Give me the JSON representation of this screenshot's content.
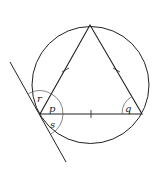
{
  "diagram": {
    "labels": {
      "r": "r",
      "p": "p",
      "s": "s",
      "q": "q"
    },
    "colors": {
      "stroke": "#222222",
      "arc": "#555555",
      "background": "#ffffff"
    }
  }
}
